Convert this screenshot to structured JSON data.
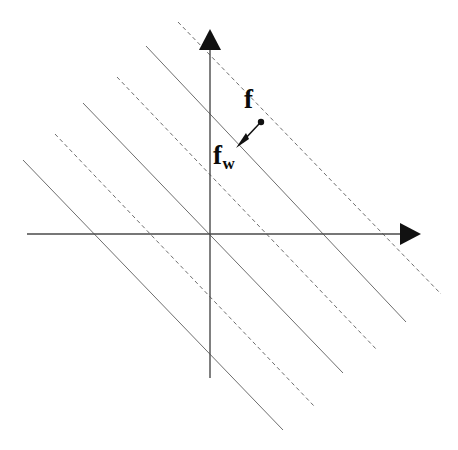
{
  "figure": {
    "type": "geometric-diagram",
    "background_color": "#ffffff",
    "labels": {
      "point_f": "f",
      "point_fw_base": "f",
      "point_fw_sub": "w"
    },
    "colors": {
      "axis": "#4a4a4a",
      "line_solid": "#6e6e6e",
      "line_dashed": "#6e6e6e",
      "arrowhead": "#111111",
      "point": "#111111",
      "label": "#0a0a0a"
    },
    "axes": {
      "x_axis": {
        "x1": 27,
        "y1": 234,
        "x2": 404,
        "y2": 234,
        "arrow": "right",
        "arrow_tip_x": 421,
        "arrow_tip_y": 234
      },
      "y_axis": {
        "x1": 210,
        "y1": 378,
        "x2": 210,
        "y2": 47,
        "arrow": "up",
        "arrow_tip_x": 210,
        "arrow_tip_y": 29
      },
      "origin": {
        "x": 210,
        "y": 234
      }
    },
    "hyperplanes": {
      "slope": -0.82,
      "count": 6,
      "pattern": [
        "dashed",
        "solid",
        "dashed",
        "solid",
        "dashed",
        "solid"
      ],
      "stroke_width": 1,
      "dash_pattern": "4 3",
      "segments": [
        {
          "style": "dashed",
          "x1": 178,
          "y1": 22,
          "x2": 441,
          "y2": 294
        },
        {
          "style": "solid",
          "x1": 146,
          "y1": 46,
          "x2": 406,
          "y2": 322
        },
        {
          "style": "dashed",
          "x1": 117,
          "y1": 77,
          "x2": 377,
          "y2": 350
        },
        {
          "style": "solid",
          "x1": 83,
          "y1": 103,
          "x2": 343,
          "y2": 373
        },
        {
          "style": "dashed",
          "x1": 55,
          "y1": 134,
          "x2": 314,
          "y2": 406
        },
        {
          "style": "solid",
          "x1": 23,
          "y1": 160,
          "x2": 283,
          "y2": 430
        }
      ]
    },
    "annotation_arrow": {
      "from_x": 261,
      "from_y": 122,
      "to_x": 238,
      "to_y": 146,
      "point_radius": 3.2,
      "label_from": "f",
      "label_to": "f_w"
    }
  }
}
